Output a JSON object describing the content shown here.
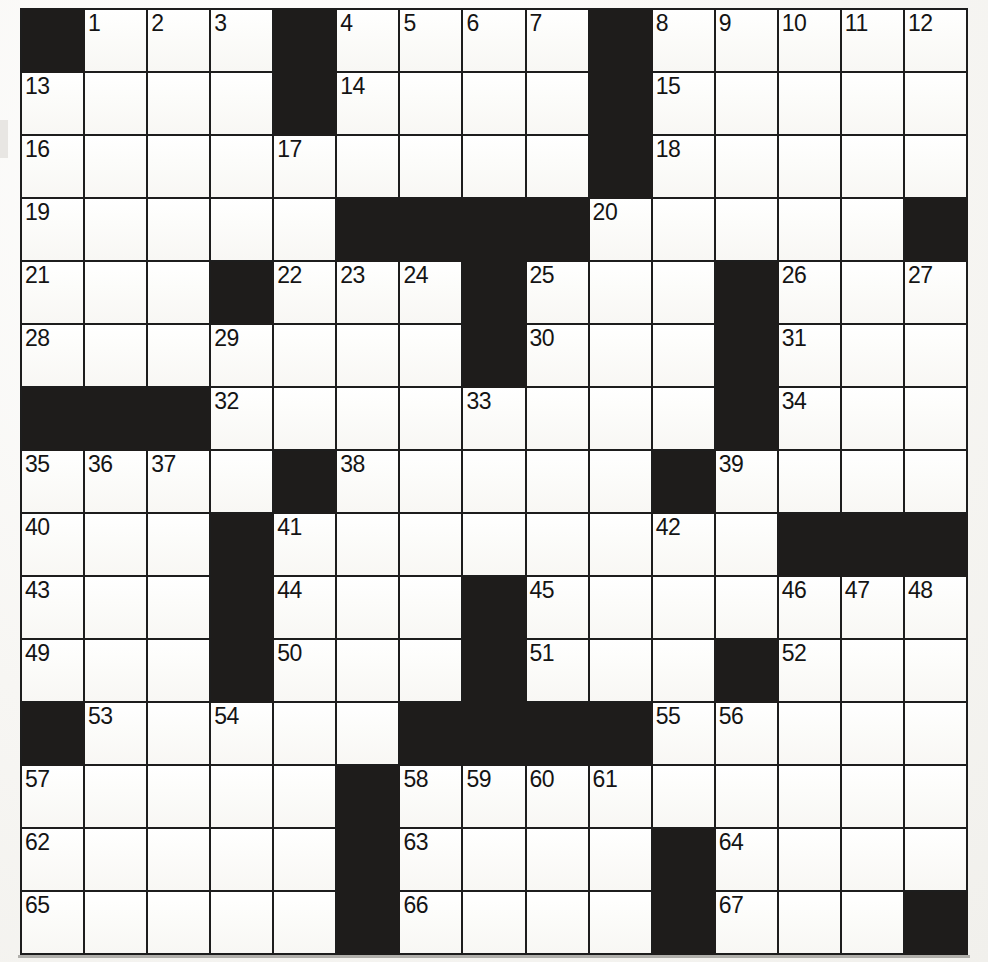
{
  "puzzle": {
    "type": "crossword-grid",
    "rows": 15,
    "cols": 15,
    "colors": {
      "block": "#1e1c1b",
      "cell": "#fdfdfb",
      "gridline": "#1d1d1d",
      "number": "#141414"
    },
    "legend": {
      "0": "white-cell",
      "1": "black-cell"
    },
    "layout": [
      [
        1,
        0,
        0,
        0,
        1,
        0,
        0,
        0,
        0,
        1,
        0,
        0,
        0,
        0,
        0
      ],
      [
        0,
        0,
        0,
        0,
        1,
        0,
        0,
        0,
        0,
        1,
        0,
        0,
        0,
        0,
        0
      ],
      [
        0,
        0,
        0,
        0,
        0,
        0,
        0,
        0,
        0,
        1,
        0,
        0,
        0,
        0,
        0
      ],
      [
        0,
        0,
        0,
        0,
        0,
        1,
        1,
        1,
        1,
        0,
        0,
        0,
        0,
        0,
        1
      ],
      [
        0,
        0,
        0,
        1,
        0,
        0,
        0,
        1,
        0,
        0,
        0,
        1,
        0,
        0,
        0
      ],
      [
        0,
        0,
        0,
        0,
        0,
        0,
        0,
        1,
        0,
        0,
        0,
        1,
        0,
        0,
        0
      ],
      [
        1,
        1,
        1,
        0,
        0,
        0,
        0,
        0,
        0,
        0,
        0,
        1,
        0,
        0,
        0
      ],
      [
        0,
        0,
        0,
        0,
        1,
        0,
        0,
        0,
        0,
        0,
        1,
        0,
        0,
        0,
        0
      ],
      [
        0,
        0,
        0,
        1,
        0,
        0,
        0,
        0,
        0,
        0,
        0,
        0,
        1,
        1,
        1
      ],
      [
        0,
        0,
        0,
        1,
        0,
        0,
        0,
        1,
        0,
        0,
        0,
        0,
        0,
        0,
        0
      ],
      [
        0,
        0,
        0,
        1,
        0,
        0,
        0,
        1,
        0,
        0,
        0,
        1,
        0,
        0,
        0
      ],
      [
        1,
        0,
        0,
        0,
        0,
        0,
        1,
        1,
        1,
        1,
        0,
        0,
        0,
        0,
        0
      ],
      [
        0,
        0,
        0,
        0,
        0,
        1,
        0,
        0,
        0,
        0,
        0,
        0,
        0,
        0,
        0
      ],
      [
        0,
        0,
        0,
        0,
        0,
        1,
        0,
        0,
        0,
        0,
        1,
        0,
        0,
        0,
        0
      ],
      [
        0,
        0,
        0,
        0,
        0,
        1,
        0,
        0,
        0,
        0,
        1,
        0,
        0,
        0,
        1
      ]
    ],
    "numbers": [
      {
        "row": 0,
        "col": 1,
        "label": "1"
      },
      {
        "row": 0,
        "col": 2,
        "label": "2"
      },
      {
        "row": 0,
        "col": 3,
        "label": "3"
      },
      {
        "row": 0,
        "col": 5,
        "label": "4"
      },
      {
        "row": 0,
        "col": 6,
        "label": "5"
      },
      {
        "row": 0,
        "col": 7,
        "label": "6"
      },
      {
        "row": 0,
        "col": 8,
        "label": "7"
      },
      {
        "row": 0,
        "col": 10,
        "label": "8"
      },
      {
        "row": 0,
        "col": 11,
        "label": "9"
      },
      {
        "row": 0,
        "col": 12,
        "label": "10"
      },
      {
        "row": 0,
        "col": 13,
        "label": "11"
      },
      {
        "row": 0,
        "col": 14,
        "label": "12"
      },
      {
        "row": 1,
        "col": 0,
        "label": "13"
      },
      {
        "row": 1,
        "col": 5,
        "label": "14"
      },
      {
        "row": 1,
        "col": 10,
        "label": "15"
      },
      {
        "row": 2,
        "col": 0,
        "label": "16"
      },
      {
        "row": 2,
        "col": 4,
        "label": "17"
      },
      {
        "row": 2,
        "col": 10,
        "label": "18"
      },
      {
        "row": 3,
        "col": 0,
        "label": "19"
      },
      {
        "row": 3,
        "col": 9,
        "label": "20"
      },
      {
        "row": 4,
        "col": 0,
        "label": "21"
      },
      {
        "row": 4,
        "col": 4,
        "label": "22"
      },
      {
        "row": 4,
        "col": 5,
        "label": "23"
      },
      {
        "row": 4,
        "col": 6,
        "label": "24"
      },
      {
        "row": 4,
        "col": 8,
        "label": "25"
      },
      {
        "row": 4,
        "col": 12,
        "label": "26"
      },
      {
        "row": 4,
        "col": 14,
        "label": "27"
      },
      {
        "row": 5,
        "col": 0,
        "label": "28"
      },
      {
        "row": 5,
        "col": 3,
        "label": "29"
      },
      {
        "row": 5,
        "col": 8,
        "label": "30"
      },
      {
        "row": 5,
        "col": 12,
        "label": "31"
      },
      {
        "row": 6,
        "col": 3,
        "label": "32"
      },
      {
        "row": 6,
        "col": 7,
        "label": "33"
      },
      {
        "row": 6,
        "col": 12,
        "label": "34"
      },
      {
        "row": 7,
        "col": 0,
        "label": "35"
      },
      {
        "row": 7,
        "col": 1,
        "label": "36"
      },
      {
        "row": 7,
        "col": 2,
        "label": "37"
      },
      {
        "row": 7,
        "col": 5,
        "label": "38"
      },
      {
        "row": 7,
        "col": 11,
        "label": "39"
      },
      {
        "row": 8,
        "col": 0,
        "label": "40"
      },
      {
        "row": 8,
        "col": 4,
        "label": "41"
      },
      {
        "row": 8,
        "col": 10,
        "label": "42"
      },
      {
        "row": 9,
        "col": 0,
        "label": "43"
      },
      {
        "row": 9,
        "col": 4,
        "label": "44"
      },
      {
        "row": 9,
        "col": 8,
        "label": "45"
      },
      {
        "row": 9,
        "col": 12,
        "label": "46"
      },
      {
        "row": 9,
        "col": 13,
        "label": "47"
      },
      {
        "row": 9,
        "col": 14,
        "label": "48"
      },
      {
        "row": 10,
        "col": 0,
        "label": "49"
      },
      {
        "row": 10,
        "col": 4,
        "label": "50"
      },
      {
        "row": 10,
        "col": 8,
        "label": "51"
      },
      {
        "row": 10,
        "col": 12,
        "label": "52"
      },
      {
        "row": 11,
        "col": 1,
        "label": "53"
      },
      {
        "row": 11,
        "col": 3,
        "label": "54"
      },
      {
        "row": 11,
        "col": 10,
        "label": "55"
      },
      {
        "row": 11,
        "col": 11,
        "label": "56"
      },
      {
        "row": 12,
        "col": 0,
        "label": "57"
      },
      {
        "row": 12,
        "col": 6,
        "label": "58"
      },
      {
        "row": 12,
        "col": 7,
        "label": "59"
      },
      {
        "row": 12,
        "col": 8,
        "label": "60"
      },
      {
        "row": 12,
        "col": 9,
        "label": "61"
      },
      {
        "row": 13,
        "col": 0,
        "label": "62"
      },
      {
        "row": 13,
        "col": 6,
        "label": "63"
      },
      {
        "row": 13,
        "col": 11,
        "label": "64"
      },
      {
        "row": 14,
        "col": 0,
        "label": "65"
      },
      {
        "row": 14,
        "col": 6,
        "label": "66"
      },
      {
        "row": 14,
        "col": 11,
        "label": "67"
      }
    ]
  }
}
